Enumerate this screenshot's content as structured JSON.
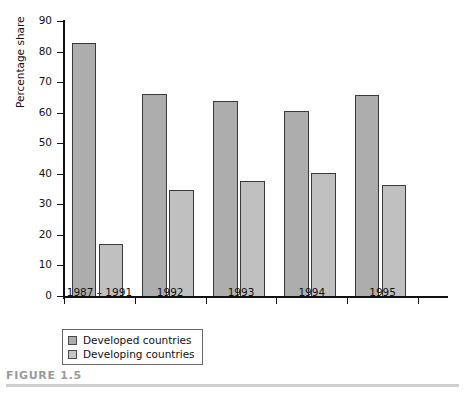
{
  "figure": {
    "caption": "FIGURE 1.5"
  },
  "chart_data": {
    "type": "bar",
    "title": "",
    "xlabel": "",
    "ylabel": "Percentage share",
    "ylim": [
      0,
      90
    ],
    "yticks": [
      0,
      10,
      20,
      30,
      40,
      50,
      60,
      70,
      80,
      90
    ],
    "ytick_labels": [
      "0",
      "10",
      "20",
      "30",
      "40",
      "50",
      "60",
      "70",
      "80",
      "90"
    ],
    "grid": false,
    "legend_position": "below-left",
    "categories": [
      "1987 – 1991",
      "1992",
      "1993",
      "1994",
      "1995"
    ],
    "series": [
      {
        "name": "Developed countries",
        "color": "#adadad",
        "values": [
          83,
          66.5,
          64,
          61,
          66
        ]
      },
      {
        "name": "Developing countries",
        "color": "#c0c0c0",
        "values": [
          17.5,
          35,
          38,
          40.5,
          36.5
        ]
      }
    ]
  },
  "legend": {
    "items": [
      {
        "label": "Developed countries",
        "swatch": "developed"
      },
      {
        "label": "Developing countries",
        "swatch": "developing"
      }
    ]
  }
}
